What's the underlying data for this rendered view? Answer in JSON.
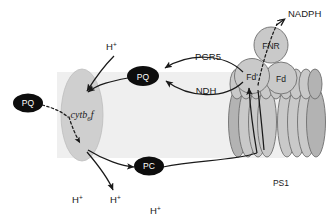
{
  "diagram": {
    "membrane": {
      "name": "thylakoid-membrane",
      "color": "#efefef"
    },
    "mobile_carriers": [
      {
        "id": "pq-free",
        "label": "PQ",
        "x": 28,
        "y": 103
      },
      {
        "id": "pq-membrane",
        "label": "PQ",
        "x": 143,
        "y": 76
      },
      {
        "id": "pc",
        "label": "PC",
        "x": 149,
        "y": 166
      }
    ],
    "complexes": [
      {
        "id": "cytb6f",
        "label": "cytb",
        "subscript": "6",
        "label_tail": "f",
        "x": 82,
        "y": 115
      },
      {
        "id": "fnr",
        "label": "FNR",
        "x": 271,
        "y": 45
      },
      {
        "id": "fd-prime",
        "label": "Fd'",
        "x": 252,
        "y": 76
      },
      {
        "id": "fd",
        "label": "Fd",
        "x": 281,
        "y": 78
      },
      {
        "id": "ps1",
        "label": "PS1",
        "x": 281,
        "y": 183
      }
    ],
    "pathways": [
      {
        "id": "pgr5",
        "label": "PGR5",
        "x": 208,
        "y": 60
      },
      {
        "id": "ndh",
        "label": "NDH",
        "x": 206,
        "y": 90
      }
    ],
    "products": [
      {
        "id": "nadph",
        "label": "NADPH",
        "x": 288,
        "y": 14
      }
    ],
    "protons": [
      {
        "id": "proton-top",
        "label": "H",
        "sup": "+",
        "x": 111,
        "y": 47
      },
      {
        "id": "proton-bottom-left",
        "label": "H",
        "sup": "+",
        "x": 76,
        "y": 200
      },
      {
        "id": "proton-bottom-mid",
        "label": "H",
        "sup": "+",
        "x": 114,
        "y": 200
      },
      {
        "id": "proton-bottom-right",
        "label": "H",
        "sup": "+",
        "x": 154,
        "y": 211
      }
    ],
    "colors": {
      "carrier_fill": "#0d0d0d",
      "carrier_text": "#ffffff",
      "protein_fill": "#c9c9c9",
      "protein_stroke": "#6e6e6e",
      "membrane_fill": "#efefef",
      "line": "#1a1a1a"
    }
  }
}
